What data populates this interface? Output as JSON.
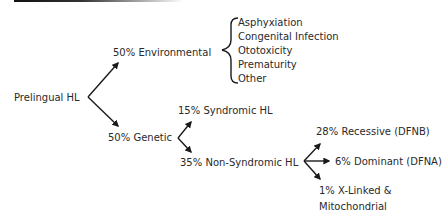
{
  "diagram": {
    "root": {
      "label": "Prelingual HL"
    },
    "environmental": {
      "label": "50% Environmental",
      "causes": [
        "Asphyxiation",
        "Congenital Infection",
        "Ototoxicity",
        "Prematurity",
        "Other"
      ]
    },
    "genetic": {
      "label": "50% Genetic",
      "syndromic": {
        "label": "15% Syndromic HL"
      },
      "non_syndromic": {
        "label": "35% Non-Syndromic HL",
        "recessive": {
          "label": "28% Recessive (DFNB)"
        },
        "dominant": {
          "label": "6% Dominant (DFNA)"
        },
        "x_linked_line1": "1% X-Linked &",
        "x_linked_line2": "Mitochondrial"
      }
    },
    "colors": {
      "line": "#1a1a1a",
      "text": "#2a2a2a"
    }
  }
}
